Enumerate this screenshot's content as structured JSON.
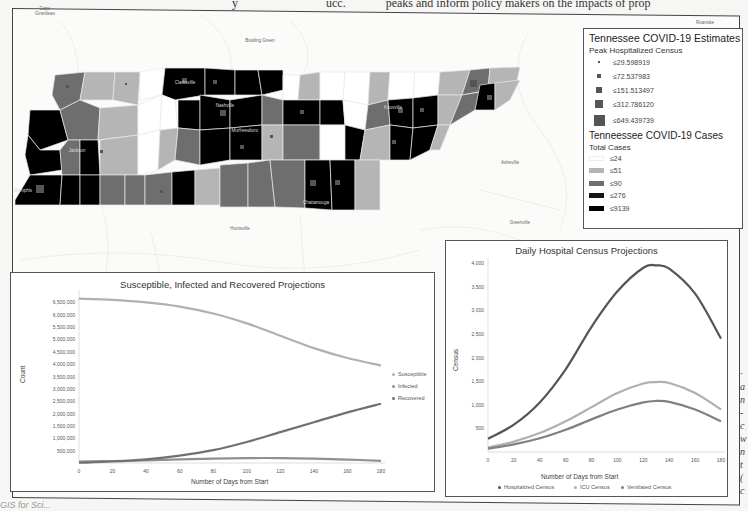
{
  "page": {
    "top_text_left": "y",
    "top_text_mid": "ucc.",
    "top_text_right": "peaks and inform policy makers on the impacts of prop",
    "side_text_chars": [
      "·",
      "a",
      "n",
      "-",
      "c",
      "w",
      "n",
      "t",
      "(",
      "c"
    ],
    "bottom_caption": "GIS for Sci..."
  },
  "map": {
    "place_labels": {
      "cape_girardeau": "Cape Girardeau",
      "bowling_green": "Bowling Green",
      "roanoke": "Roanoke",
      "asheville": "Asheville",
      "greenville": "Greenville",
      "huntsville": "Huntsville",
      "clarksville": "Clarksville",
      "nashville": "Nashville",
      "murfreesboro": "Murfreesboro",
      "jackson": "Jackson",
      "memphis": "Memphis",
      "knoxville": "Knoxville",
      "chattanooga": "Chattanooga",
      "johnson_city": "Johnson City",
      "bristol": "Bristol",
      "kingsport": "Kingsport"
    },
    "colors": {
      "le24": "#ffffff",
      "le51": "#b5b5b5",
      "le90": "#6e6e6e",
      "le276": "#0a0a0a",
      "le9139": "#000000",
      "marker": "#555555"
    }
  },
  "legend": {
    "title": "Tennessee COVID-19 Estimates",
    "subtitle1": "Peak Hospitalized Census",
    "census_classes": [
      {
        "label": "≤29.598919",
        "size": 2
      },
      {
        "label": "≤72.537983",
        "size": 4
      },
      {
        "label": "≤151.513497",
        "size": 6
      },
      {
        "label": "≤312.786120",
        "size": 8
      },
      {
        "label": "≤649.439739",
        "size": 11
      }
    ],
    "title2": "Tenneessee COVID-19 Cases",
    "subtitle2": "Total Cases",
    "case_classes": [
      {
        "label": "≤24",
        "color": "#ffffff"
      },
      {
        "label": "≤51",
        "color": "#b5b5b5"
      },
      {
        "label": "≤90",
        "color": "#6e6e6e"
      },
      {
        "label": "≤276",
        "color": "#151515"
      },
      {
        "label": "≤9139",
        "color": "#000000"
      }
    ]
  },
  "chart_data": [
    {
      "type": "line",
      "title": "Susceptible, Infected and Recovered Projections",
      "xlabel": "Number of Days from Start",
      "ylabel": "Count",
      "x": [
        0,
        20,
        40,
        60,
        80,
        100,
        120,
        140,
        160,
        180
      ],
      "xticks": [
        "0",
        "20",
        "40",
        "60",
        "80",
        "100",
        "120",
        "140",
        "160",
        "180"
      ],
      "yticks": [
        "500,000",
        "1,000,000",
        "1,500,000",
        "2,000,000",
        "2,500,000",
        "3,000,000",
        "3,500,000",
        "4,000,000",
        "4,500,000",
        "5,000,000",
        "5,500,000",
        "6,000,000",
        "6,500,000"
      ],
      "ylim": [
        0,
        6800000
      ],
      "legend_position": "right",
      "series": [
        {
          "name": "Susceptible",
          "color": "#b0b0b0",
          "values": [
            6650000,
            6600000,
            6500000,
            6330000,
            6050000,
            5650000,
            5150000,
            4650000,
            4250000,
            3950000
          ]
        },
        {
          "name": "Infected",
          "color": "#909090",
          "values": [
            60000,
            80000,
            110000,
            150000,
            180000,
            200000,
            200000,
            180000,
            140000,
            90000
          ]
        },
        {
          "name": "Recovered",
          "color": "#707070",
          "values": [
            10000,
            60000,
            150000,
            300000,
            520000,
            850000,
            1250000,
            1650000,
            2050000,
            2400000
          ]
        }
      ]
    },
    {
      "type": "line",
      "title": "Daily Hospital Census Projections",
      "xlabel": "Number of Days from Start",
      "ylabel": "Census",
      "x": [
        0,
        20,
        40,
        60,
        80,
        100,
        120,
        130,
        140,
        160,
        180
      ],
      "xticks": [
        "0",
        "20",
        "40",
        "60",
        "80",
        "100",
        "120",
        "140",
        "160",
        "180"
      ],
      "yticks": [
        "500",
        "1,000",
        "1,500",
        "2,000",
        "2,500",
        "3,000",
        "3,500",
        "4,000"
      ],
      "ylim": [
        0,
        4000
      ],
      "legend_position": "bottom",
      "series": [
        {
          "name": "Hospitalized Census",
          "color": "#555555",
          "values": [
            280,
            580,
            1050,
            1750,
            2650,
            3400,
            3900,
            3950,
            3880,
            3350,
            2400
          ]
        },
        {
          "name": "ICU Census",
          "color": "#b0b0b0",
          "values": [
            100,
            220,
            400,
            650,
            950,
            1250,
            1450,
            1480,
            1460,
            1250,
            900
          ]
        },
        {
          "name": "Ventilated Census",
          "color": "#808080",
          "values": [
            70,
            160,
            290,
            470,
            690,
            900,
            1050,
            1080,
            1060,
            900,
            650
          ]
        }
      ]
    }
  ]
}
